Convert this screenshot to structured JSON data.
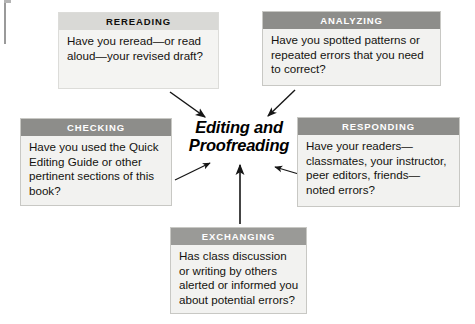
{
  "diagram": {
    "center": {
      "line1": "Editing and",
      "line2": "Proofreading"
    },
    "boxes": [
      {
        "id": "rereading",
        "heading": "REREADING",
        "body": "Have you reread—or read aloud—your revised draft?",
        "header_style": "light",
        "header_bg": "#d9d9d6",
        "header_color": "#100e0c",
        "body_bg": "#f4f4f2"
      },
      {
        "id": "analyzing",
        "heading": "ANALYZING",
        "body": "Have you spotted patterns or repeated errors that you need to correct?",
        "header_style": "dark",
        "header_bg": "#8d8d8a",
        "header_color": "#ffffff",
        "body_bg": "#f2f2f0"
      },
      {
        "id": "checking",
        "heading": "CHECKING",
        "body": "Have you used the Quick Editing Guide or other pertinent sections of this book?",
        "header_style": "dark",
        "header_bg": "#8d8d8a",
        "header_color": "#ffffff",
        "body_bg": "#f2f2f0"
      },
      {
        "id": "responding",
        "heading": "RESPONDING",
        "body": "Have your readers— classmates, your instructor, peer editors, friends— noted errors?",
        "header_style": "dark",
        "header_bg": "#8d8d8a",
        "header_color": "#ffffff",
        "body_bg": "#f2f2f0"
      },
      {
        "id": "exchanging",
        "heading": "EXCHANGING",
        "body": "Has class discussion or writing by others alerted or informed you about potential errors?",
        "header_style": "mid",
        "header_bg": "#9a9a97",
        "header_color": "#ffffff",
        "body_bg": "#f2f2f0"
      }
    ],
    "arrows": [
      {
        "from": "rereading",
        "to": "center",
        "direction": "down-right"
      },
      {
        "from": "analyzing",
        "to": "center",
        "direction": "down-left"
      },
      {
        "from": "checking",
        "to": "center",
        "direction": "up-right"
      },
      {
        "from": "responding",
        "to": "center",
        "direction": "left"
      },
      {
        "from": "exchanging",
        "to": "center",
        "direction": "up"
      }
    ],
    "colors": {
      "page_background": "#ffffff",
      "arrow": "#161616",
      "box_border": "#c8c8c4",
      "text": "#14120f"
    }
  }
}
